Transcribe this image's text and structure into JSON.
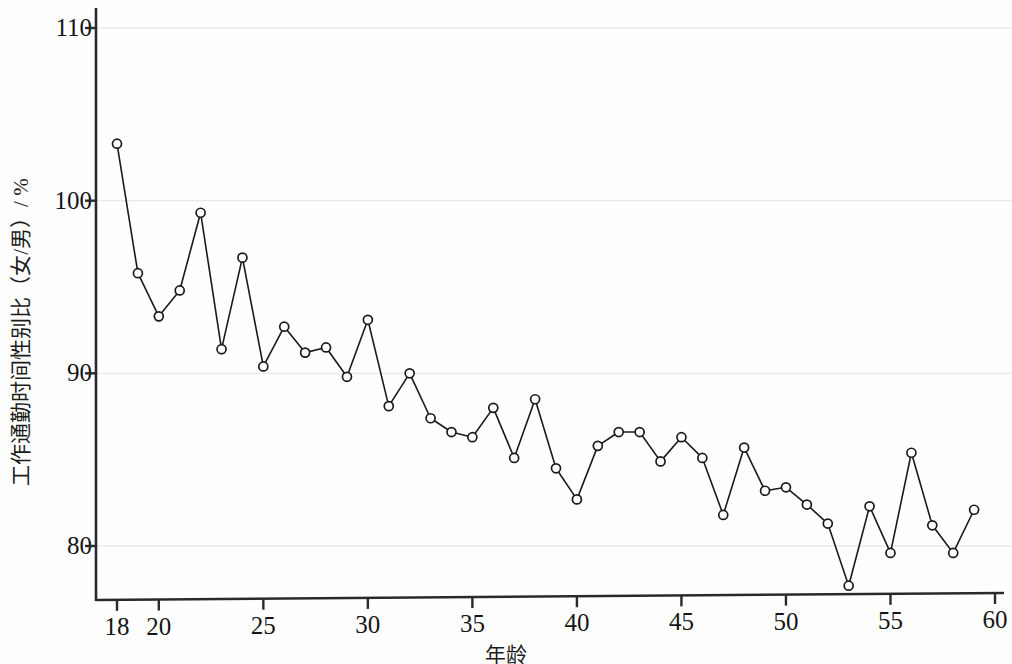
{
  "chart_data": {
    "type": "line",
    "title": "",
    "subtitle": "",
    "xlabel": "年龄",
    "ylabel": "工作通勤时间性别比（女/男）/ %",
    "xlim": [
      17.0,
      60.4
    ],
    "ylim": [
      77.0,
      111.2
    ],
    "xticks": [
      18,
      20,
      25,
      30,
      35,
      40,
      45,
      50,
      55,
      60
    ],
    "xticklabels": [
      "18",
      "20",
      "25",
      "30",
      "35",
      "40",
      "45",
      "50",
      "55",
      "60"
    ],
    "yticks": [
      80,
      90,
      100,
      110
    ],
    "yticklabels": [
      "80",
      "90",
      "100",
      "110"
    ],
    "grid": "horizontal-major-only",
    "grid_color": "#e8e8ec",
    "legend": null,
    "marker": "open-circle",
    "marker_size": 9,
    "line_color": "#1a1a1a",
    "line_width": 1.6,
    "x": [
      18,
      19,
      20,
      21,
      22,
      23,
      24,
      25,
      26,
      27,
      28,
      29,
      30,
      31,
      32,
      33,
      34,
      35,
      36,
      37,
      38,
      39,
      40,
      41,
      42,
      43,
      44,
      45,
      46,
      47,
      48,
      49,
      50,
      51,
      52,
      53,
      54,
      55,
      56,
      57,
      58,
      59
    ],
    "values": [
      103.3,
      95.8,
      93.3,
      94.8,
      99.3,
      91.4,
      96.7,
      90.4,
      92.7,
      91.2,
      91.5,
      89.8,
      93.1,
      88.1,
      90.0,
      87.4,
      86.6,
      86.3,
      88.0,
      85.1,
      88.5,
      84.5,
      82.7,
      85.8,
      86.6,
      86.6,
      84.9,
      86.3,
      85.1,
      81.8,
      85.7,
      83.2,
      83.4,
      82.4,
      81.3,
      77.7,
      82.3,
      79.6,
      85.4,
      81.2,
      79.6,
      82.1
    ],
    "series": [
      {
        "name": "工作通勤时间性别比（女/男）",
        "values": [
          103.3,
          95.8,
          93.3,
          94.8,
          99.3,
          91.4,
          96.7,
          90.4,
          92.7,
          91.2,
          91.5,
          89.8,
          93.1,
          88.1,
          90.0,
          87.4,
          86.6,
          86.3,
          88.0,
          85.1,
          88.5,
          84.5,
          82.7,
          85.8,
          86.6,
          86.6,
          84.9,
          86.3,
          85.1,
          81.8,
          85.7,
          83.2,
          83.4,
          82.4,
          81.3,
          77.7,
          82.3,
          79.6,
          85.4,
          81.2,
          79.6,
          82.1
        ]
      }
    ]
  },
  "axes": {
    "y_axis_title": "工作通勤时间性别比（女/男）/ %",
    "x_axis_title": "年龄"
  }
}
